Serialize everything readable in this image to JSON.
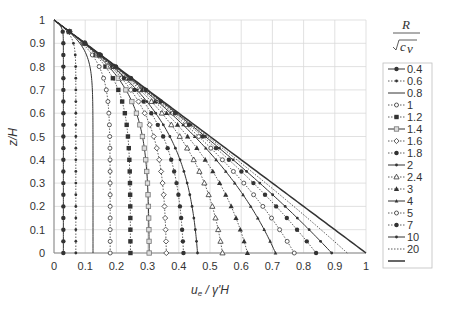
{
  "chart_data": {
    "type": "line",
    "title": "",
    "xlabel": "u_e / γ'H",
    "ylabel": "z/H",
    "xlim": [
      0,
      1
    ],
    "ylim": [
      0,
      1
    ],
    "xticks": [
      "0",
      "0.1",
      "0.2",
      "0.3",
      "0.4",
      "0.5",
      "0.6",
      "0.7",
      "0.8",
      "0.9",
      "1"
    ],
    "yticks": [
      "0",
      "0.1",
      "0.2",
      "0.3",
      "0.4",
      "0.5",
      "0.6",
      "0.7",
      "0.8",
      "0.9",
      "1"
    ],
    "grid": true,
    "legend_title": "R / √c_v",
    "legend_position": "right",
    "series": [
      {
        "name": "0.4",
        "u_at_z0": 0.03,
        "style": "solid",
        "marker": "dot-filled"
      },
      {
        "name": "0.6",
        "u_at_z0": 0.07,
        "style": "dotted",
        "marker": "dot-small"
      },
      {
        "name": "0.8",
        "u_at_z0": 0.125,
        "style": "solid",
        "marker": "none"
      },
      {
        "name": "1",
        "u_at_z0": 0.18,
        "style": "dotted",
        "marker": "circle-open"
      },
      {
        "name": "1.2",
        "u_at_z0": 0.245,
        "style": "dotted",
        "marker": "square-filled"
      },
      {
        "name": "1.4",
        "u_at_z0": 0.305,
        "style": "solid",
        "marker": "square-open"
      },
      {
        "name": "1.6",
        "u_at_z0": 0.36,
        "style": "dotted",
        "marker": "diamond-open"
      },
      {
        "name": "1.8",
        "u_at_z0": 0.415,
        "style": "dotted",
        "marker": "dot-filled"
      },
      {
        "name": "2",
        "u_at_z0": 0.46,
        "style": "solid",
        "marker": "dot-small"
      },
      {
        "name": "2.4",
        "u_at_z0": 0.54,
        "style": "dotted",
        "marker": "triangle-open"
      },
      {
        "name": "3",
        "u_at_z0": 0.62,
        "style": "dotted",
        "marker": "triangle-filled"
      },
      {
        "name": "4",
        "u_at_z0": 0.71,
        "style": "solid",
        "marker": "triangle-small"
      },
      {
        "name": "5",
        "u_at_z0": 0.77,
        "style": "dotted",
        "marker": "circle-open"
      },
      {
        "name": "7",
        "u_at_z0": 0.84,
        "style": "dotted",
        "marker": "dot-filled"
      },
      {
        "name": "10",
        "u_at_z0": 0.89,
        "style": "solid",
        "marker": "dot-small"
      },
      {
        "name": "20",
        "u_at_z0": 0.94,
        "style": "dotted",
        "marker": "none"
      },
      {
        "name": "",
        "u_at_z0": 1.0,
        "style": "solid-thick",
        "marker": "none"
      }
    ],
    "z_samples": [
      0,
      0.05,
      0.1,
      0.15,
      0.2,
      0.25,
      0.3,
      0.35,
      0.4,
      0.45,
      0.5,
      0.55,
      0.6,
      0.65,
      0.7,
      0.75,
      0.8,
      0.85,
      0.9,
      0.95,
      1.0
    ],
    "all_curves_start_at": {
      "u": 0,
      "z": 1
    }
  },
  "colors": {
    "line": "#333333",
    "grid": "#d9d9d9",
    "axis": "#888888",
    "legend_border": "#bfbfbf"
  }
}
